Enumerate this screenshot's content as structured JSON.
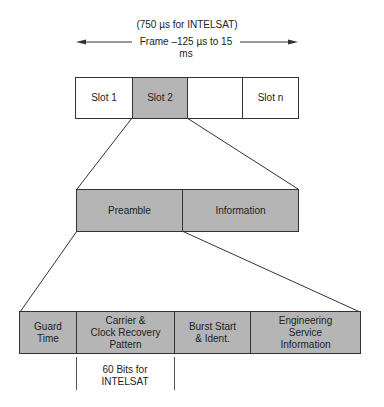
{
  "frame": {
    "intelsat_note": "(750 µs for INTELSAT)",
    "label": "Frame –125 µs to 15 ms"
  },
  "slots": [
    {
      "label": "Slot 1",
      "highlighted": false
    },
    {
      "label": "Slot 2",
      "highlighted": true
    },
    {
      "label": "",
      "highlighted": false
    },
    {
      "label": "Slot n",
      "highlighted": false
    }
  ],
  "burst": {
    "preamble": "Preamble",
    "information": "Information"
  },
  "preamble_fields": [
    {
      "line1": "Guard",
      "line2": "Time",
      "line3": ""
    },
    {
      "line1": "Carrier &",
      "line2": "Clock Recovery",
      "line3": "Pattern"
    },
    {
      "line1": "Burst Start",
      "line2": "& Ident.",
      "line3": ""
    },
    {
      "line1": "Engineering",
      "line2": "Service",
      "line3": "Information"
    }
  ],
  "annotation": {
    "line1": "60 Bits for",
    "line2": "INTELSAT"
  },
  "colors": {
    "fill": "#b5b5b5",
    "stroke": "#333333"
  }
}
